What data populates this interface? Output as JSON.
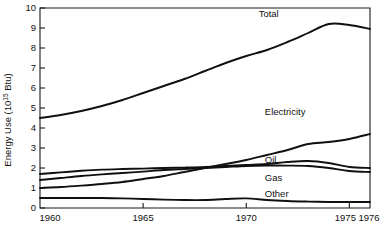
{
  "chart_data": {
    "type": "line",
    "title": "",
    "xlabel": "",
    "ylabel": "Energy Use (10¹⁵ Btu)",
    "ylabel_main": "Energy Use (10",
    "ylabel_sup": "15",
    "ylabel_tail": " Btu)",
    "xlim": [
      1960,
      1976
    ],
    "ylim": [
      0,
      10
    ],
    "grid": false,
    "legend_position": "inline-labels",
    "ytick_labels": [
      "0",
      "1",
      "2",
      "3",
      "4",
      "5",
      "6",
      "7",
      "8",
      "9",
      "10"
    ],
    "ytick_values": [
      0,
      1,
      2,
      3,
      4,
      5,
      6,
      7,
      8,
      9,
      10
    ],
    "xtick_labels": [
      "1960",
      "1965",
      "1970",
      "1975",
      "1976"
    ],
    "xtick_values": [
      1960,
      1965,
      1970,
      1975,
      1976
    ],
    "x": [
      1960,
      1961,
      1962,
      1963,
      1964,
      1965,
      1966,
      1967,
      1968,
      1969,
      1970,
      1971,
      1972,
      1973,
      1974,
      1975,
      1976
    ],
    "series": [
      {
        "name": "Total",
        "label": "Total",
        "label_x": 1970.6,
        "label_y": 9.55,
        "values": [
          4.5,
          4.65,
          4.85,
          5.1,
          5.4,
          5.75,
          6.1,
          6.45,
          6.85,
          7.25,
          7.6,
          7.9,
          8.3,
          8.75,
          9.2,
          9.15,
          8.95
        ]
      },
      {
        "name": "Electricity",
        "label": "Electricity",
        "label_x": 1970.9,
        "label_y": 4.65,
        "values": [
          1.0,
          1.05,
          1.12,
          1.2,
          1.3,
          1.45,
          1.6,
          1.8,
          2.0,
          2.2,
          2.4,
          2.65,
          2.9,
          3.2,
          3.3,
          3.45,
          3.7
        ]
      },
      {
        "name": "Oil",
        "label": "Oil",
        "label_x": 1970.9,
        "label_y": 2.25,
        "values": [
          1.7,
          1.78,
          1.86,
          1.92,
          1.95,
          1.97,
          2.0,
          2.02,
          2.05,
          2.1,
          2.15,
          2.2,
          2.3,
          2.35,
          2.25,
          2.05,
          2.0
        ]
      },
      {
        "name": "Gas",
        "label": "Gas",
        "label_x": 1970.9,
        "label_y": 1.35,
        "values": [
          1.4,
          1.5,
          1.6,
          1.68,
          1.75,
          1.82,
          1.9,
          1.95,
          2.0,
          2.05,
          2.1,
          2.12,
          2.12,
          2.1,
          2.0,
          1.85,
          1.8
        ]
      },
      {
        "name": "Other",
        "label": "Other",
        "label_x": 1970.9,
        "label_y": 0.55,
        "values": [
          0.5,
          0.5,
          0.5,
          0.5,
          0.48,
          0.45,
          0.42,
          0.4,
          0.4,
          0.45,
          0.48,
          0.4,
          0.35,
          0.32,
          0.3,
          0.3,
          0.3
        ]
      }
    ]
  },
  "axes": {
    "y_axis_name": "energy-use-axis",
    "x_axis_name": "year-axis"
  },
  "colors": {
    "line": "#101010",
    "axis": "#1a1a1a",
    "background": "#ffffff"
  }
}
